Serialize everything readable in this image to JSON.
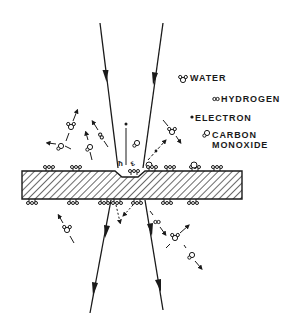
{
  "legend": {
    "water": "WATER",
    "hydrogen": "HYDROGEN",
    "electron": "ELECTRON",
    "carbon_monoxide_line1": "CARBON",
    "carbon_monoxide_line2": "MONOXIDE"
  },
  "colors": {
    "ink": "#1a1a1a",
    "background": "#ffffff"
  }
}
